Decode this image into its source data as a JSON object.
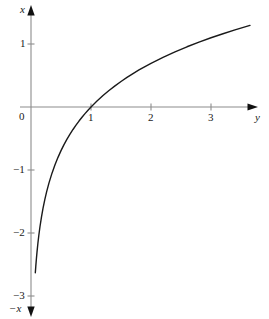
{
  "figure": {
    "background_color": "#ffffff",
    "curve_color": "#1a1a1a",
    "axis_color": "#8c8c8c",
    "arrow_color": "#111111",
    "text_color": "#1a1a1a"
  },
  "axes": {
    "vertical_label": "x",
    "vertical_label_negative": "−x",
    "horizontal_label": "y",
    "origin_label": "0"
  },
  "chart_data": {
    "type": "line",
    "title": "",
    "subtitle": "",
    "xlabel": "y",
    "ylabel": "x",
    "grid": false,
    "legend": null,
    "function": "x = ln(y)",
    "xlim": [
      0,
      3.95
    ],
    "ylim": [
      -3.35,
      1.6
    ],
    "xticks": [
      0,
      1,
      2,
      3
    ],
    "xtick_labels": [
      "0",
      "1",
      "2",
      "3"
    ],
    "yticks": [
      1,
      -1,
      -2,
      -3
    ],
    "ytick_labels": [
      "1",
      "−1",
      "−2",
      "−3"
    ],
    "origin_tick_label": "0",
    "x_axis_arrow": "right",
    "y_axis_arrow_up": true,
    "y_axis_arrow_down": true,
    "series": [
      {
        "name": "x = ln(y)",
        "color": "#1a1a1a",
        "x": [
          0.072,
          0.08,
          0.09,
          0.1,
          0.115,
          0.13,
          0.15,
          0.175,
          0.2,
          0.23,
          0.26,
          0.3,
          0.35,
          0.4,
          0.45,
          0.5,
          0.55,
          0.6,
          0.65,
          0.7,
          0.75,
          0.8,
          0.85,
          0.9,
          0.95,
          1.0,
          1.1,
          1.2,
          1.3,
          1.4,
          1.5,
          1.6,
          1.7,
          1.8,
          1.9,
          2.0,
          2.2,
          2.4,
          2.6,
          2.8,
          3.0,
          3.2,
          3.4,
          3.65
        ],
        "y": [
          -2.631,
          -2.526,
          -2.408,
          -2.303,
          -2.163,
          -2.04,
          -1.897,
          -1.743,
          -1.609,
          -1.47,
          -1.347,
          -1.204,
          -1.05,
          -0.916,
          -0.799,
          -0.693,
          -0.598,
          -0.511,
          -0.431,
          -0.357,
          -0.288,
          -0.223,
          -0.163,
          -0.105,
          -0.051,
          0.0,
          0.095,
          0.182,
          0.262,
          0.336,
          0.405,
          0.47,
          0.531,
          0.588,
          0.642,
          0.693,
          0.788,
          0.875,
          0.956,
          1.03,
          1.099,
          1.163,
          1.224,
          1.295
        ]
      }
    ]
  }
}
